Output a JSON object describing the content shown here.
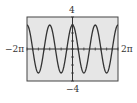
{
  "chart_data": {
    "type": "line",
    "title": "",
    "function": "y = 3cos(2x)",
    "xlabel": "",
    "ylabel": "",
    "xlim": [
      -6.2832,
      6.2832
    ],
    "ylim": [
      -4,
      4
    ],
    "x_tick_labels": {
      "min": "−2π",
      "max": "2π"
    },
    "y_tick_labels": {
      "max": "4",
      "min": "−4"
    },
    "x_tick_step": 0.7854,
    "y_tick_step": 1,
    "grid": false,
    "legend": null,
    "series": [
      {
        "name": "y = 3cos(2x)",
        "amplitude": 3,
        "period": 3.1416,
        "x": [
          -6.2832,
          -5.4978,
          -4.7124,
          -3.927,
          -3.1416,
          -2.3562,
          -1.5708,
          -0.7854,
          0,
          0.7854,
          1.5708,
          2.3562,
          3.1416,
          3.927,
          4.7124,
          5.4978,
          6.2832
        ],
        "values": [
          3,
          0,
          -3,
          0,
          3,
          0,
          -3,
          0,
          3,
          0,
          -3,
          0,
          3,
          0,
          -3,
          0,
          3
        ]
      }
    ]
  },
  "colors": {
    "plot_background": "#e6e6e6",
    "frame": "#444444",
    "curve": "#333333",
    "axes": "#333333"
  }
}
